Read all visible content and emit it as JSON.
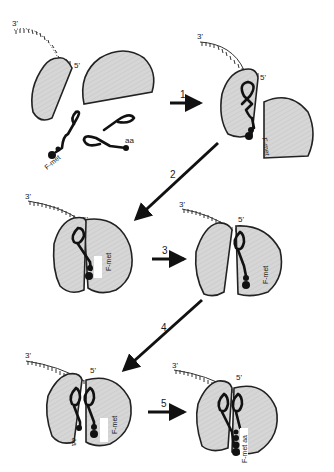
{
  "diagram": {
    "type": "translation-initiation-steps",
    "colors": {
      "subunit_fill": "#d4d4d4",
      "outline": "#222222",
      "background": "#ffffff"
    },
    "labels": {
      "mrna_3": "3'",
      "mrna_5": "5'",
      "fmet": "F-met",
      "aa": "aa",
      "fmet_aa": "F-met aa"
    },
    "steps": [
      {
        "number": "1",
        "from": "free components",
        "to": "30S initiation complex"
      },
      {
        "number": "2",
        "from": "30S initiation complex",
        "to": "70S complex, P site"
      },
      {
        "number": "3",
        "from": "70S complex",
        "to": "opened complex"
      },
      {
        "number": "4",
        "from": "opened complex",
        "to": "P + A site tRNAs"
      },
      {
        "number": "5",
        "from": "P + A site tRNAs",
        "to": "peptide bond formed"
      }
    ]
  }
}
